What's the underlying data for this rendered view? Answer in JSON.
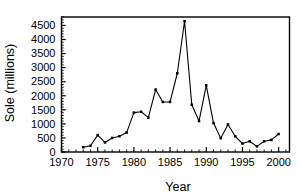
{
  "chart_data": {
    "type": "line",
    "title": "",
    "xlabel": "Year",
    "ylabel": "Sole (millions)",
    "xlim": [
      1970,
      2001.5
    ],
    "ylim": [
      0,
      4800
    ],
    "grid": false,
    "legend": null,
    "x_ticks": [
      1970,
      1975,
      1980,
      1985,
      1990,
      1995,
      2000
    ],
    "x_tick_labels": [
      "1970",
      "1975",
      "1980",
      "1985",
      "1990",
      "1995",
      "2000"
    ],
    "x_minor_tick_step": 1,
    "y_ticks": [
      0,
      500,
      1000,
      1500,
      2000,
      2500,
      3000,
      3500,
      4000,
      4500
    ],
    "y_tick_labels": [
      "0",
      "500",
      "1000",
      "1500",
      "2000",
      "2500",
      "3000",
      "3500",
      "4000",
      "4500"
    ],
    "y_minor_tick_step": 100,
    "marker": "filled-square",
    "line_color": "#000000",
    "marker_color": "#000000",
    "x": [
      1973,
      1974,
      1975,
      1976,
      1977,
      1978,
      1979,
      1980,
      1981,
      1982,
      1983,
      1984,
      1985,
      1986,
      1987,
      1988,
      1989,
      1990,
      1991,
      1992,
      1993,
      1994,
      1995,
      1996,
      1997,
      1998,
      1999,
      2000
    ],
    "values": [
      170,
      220,
      600,
      340,
      500,
      560,
      690,
      1400,
      1430,
      1220,
      2220,
      1780,
      1780,
      2800,
      4650,
      1680,
      1100,
      2370,
      1030,
      490,
      980,
      560,
      300,
      380,
      200,
      380,
      430,
      640
    ],
    "series": [
      {
        "name": "Sole",
        "values": [
          170,
          220,
          600,
          340,
          500,
          560,
          690,
          1400,
          1430,
          1220,
          2220,
          1780,
          1780,
          2800,
          4650,
          1680,
          1100,
          2370,
          1030,
          490,
          980,
          560,
          300,
          380,
          200,
          380,
          430,
          640
        ]
      }
    ]
  },
  "axes": {
    "x_title": "Year",
    "y_title": "Sole (millions)"
  }
}
